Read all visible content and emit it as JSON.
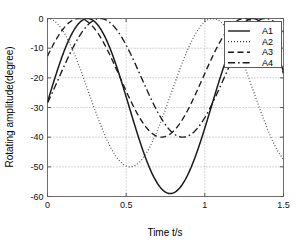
{
  "chart_data": {
    "type": "line",
    "title": "",
    "xlabel": "Time t/s",
    "ylabel": "Rotating amplitude(degree)",
    "xlim": [
      0,
      1.5
    ],
    "ylim": [
      -60,
      0
    ],
    "xticks": [
      0,
      0.5,
      1,
      1.5
    ],
    "xtick_labels": [
      "0",
      "0.5",
      "1",
      "1.5"
    ],
    "yticks": [
      0,
      -10,
      -20,
      -30,
      -40,
      -50,
      -60
    ],
    "ytick_labels": [
      "0",
      "-10",
      "-20",
      "-30",
      "-40",
      "-50",
      "-60"
    ],
    "grid": true,
    "legend_position": "upper right",
    "series": [
      {
        "name": "A1",
        "style": "solid",
        "amplitude": 29.5,
        "mean": -29.5,
        "period": 1.05,
        "phase_peak_time": 0.255,
        "min": -59.0,
        "max": 0.0,
        "x": [
          0.0,
          0.05,
          0.1,
          0.15,
          0.2,
          0.25,
          0.3,
          0.35,
          0.4,
          0.45,
          0.5,
          0.55,
          0.6,
          0.65,
          0.7,
          0.75,
          0.8,
          0.85,
          0.9,
          0.95,
          1.0,
          1.05,
          1.1,
          1.15,
          1.2,
          1.25,
          1.3,
          1.35,
          1.4,
          1.45,
          1.5
        ],
        "y": [
          -29.5,
          -21.1,
          -13.3,
          -6.8,
          -2.4,
          -0.4,
          -1.1,
          -4.3,
          -9.8,
          -17.0,
          -25.2,
          -33.7,
          -41.5,
          -48.1,
          -53.6,
          -57.3,
          -59.0,
          -58.6,
          -56.0,
          -51.5,
          -45.4,
          -38.1,
          -30.2,
          -22.1,
          -14.4,
          -8.0,
          -3.4,
          -0.8,
          -0.5,
          -2.7,
          -7.2
        ]
      },
      {
        "name": "A2",
        "style": "dotted",
        "amplitude": 25.0,
        "mean": -25.0,
        "period": 1.05,
        "phase_peak_time": 0.0,
        "min": -50.0,
        "max": 0.0,
        "x": [
          0.0,
          0.05,
          0.1,
          0.15,
          0.2,
          0.25,
          0.3,
          0.35,
          0.4,
          0.45,
          0.5,
          0.55,
          0.6,
          0.65,
          0.7,
          0.75,
          0.8,
          0.85,
          0.9,
          0.95,
          1.0,
          1.05,
          1.1,
          1.15,
          1.2,
          1.25,
          1.3,
          1.35,
          1.4,
          1.45,
          1.5
        ],
        "y": [
          0.0,
          -1.1,
          -4.4,
          -9.7,
          -16.5,
          -24.2,
          -32.1,
          -39.3,
          -45.3,
          -48.8,
          -50.0,
          -48.6,
          -44.9,
          -39.1,
          -31.9,
          -24.0,
          -16.3,
          -9.5,
          -4.3,
          -1.1,
          0.0,
          -1.2,
          -4.5,
          -9.9,
          -16.7,
          -24.4,
          -32.3,
          -39.4,
          -45.4,
          -48.9,
          -50.0
        ]
      },
      {
        "name": "A3",
        "style": "dashed",
        "amplitude": 20.0,
        "mean": -20.0,
        "period": 1.05,
        "phase_peak_time": 0.2,
        "min": -40.0,
        "max": 0.0,
        "x": [
          0.0,
          0.05,
          0.1,
          0.15,
          0.2,
          0.25,
          0.3,
          0.35,
          0.4,
          0.45,
          0.5,
          0.55,
          0.6,
          0.65,
          0.7,
          0.75,
          0.8,
          0.85,
          0.9,
          0.95,
          1.0,
          1.05,
          1.1,
          1.15,
          1.2,
          1.25,
          1.3,
          1.35,
          1.4,
          1.45,
          1.5
        ],
        "y": [
          -13.0,
          -7.3,
          -3.0,
          -0.5,
          -0.1,
          -1.9,
          -5.7,
          -11.0,
          -17.3,
          -23.9,
          -30.0,
          -35.2,
          -38.5,
          -40.0,
          -39.3,
          -36.4,
          -31.7,
          -25.8,
          -19.4,
          -13.2,
          -7.6,
          -3.3,
          -0.7,
          -0.1,
          -1.7,
          -5.3,
          -10.5,
          -16.7,
          -23.3,
          -29.5,
          -34.8
        ]
      },
      {
        "name": "A4",
        "style": "dashdot",
        "amplitude": 20.0,
        "mean": -20.0,
        "period": 1.05,
        "phase_peak_time": 0.335,
        "min": -40.0,
        "max": 0.0,
        "x": [
          0.0,
          0.05,
          0.1,
          0.15,
          0.2,
          0.25,
          0.3,
          0.35,
          0.4,
          0.45,
          0.5,
          0.55,
          0.6,
          0.65,
          0.7,
          0.75,
          0.8,
          0.85,
          0.9,
          0.95,
          1.0,
          1.05,
          1.1,
          1.15,
          1.2,
          1.25,
          1.3,
          1.35,
          1.4,
          1.45,
          1.5
        ],
        "y": [
          -30.0,
          -24.3,
          -18.2,
          -12.3,
          -7.1,
          -3.1,
          -0.7,
          -0.1,
          -1.4,
          -4.4,
          -9.0,
          -14.7,
          -21.0,
          -27.2,
          -32.8,
          -37.0,
          -39.5,
          -39.9,
          -38.3,
          -34.7,
          -29.6,
          -23.6,
          -17.4,
          -11.5,
          -6.5,
          -2.7,
          -0.5,
          -0.2,
          -1.8,
          -5.1,
          -9.8
        ]
      }
    ]
  },
  "legend": {
    "items": [
      {
        "label": "A1",
        "style": "solid"
      },
      {
        "label": "A2",
        "style": "dotted"
      },
      {
        "label": "A3",
        "style": "dashed"
      },
      {
        "label": "A4",
        "style": "dashdot"
      }
    ]
  }
}
